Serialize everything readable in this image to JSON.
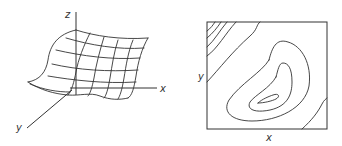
{
  "surface_plot": {
    "axes": {
      "x_label": "x",
      "y_label": "y",
      "z_label": "z"
    }
  },
  "contour_plot": {
    "axes": {
      "x_label": "x",
      "y_label": "y"
    }
  },
  "colors": {
    "line": "#333333",
    "background": "#ffffff"
  }
}
